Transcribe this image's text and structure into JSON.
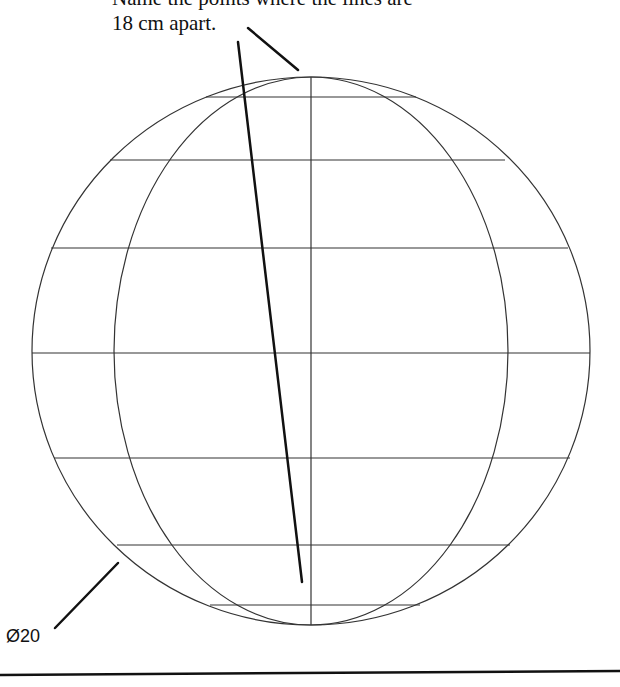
{
  "annotation": {
    "clipped_line": "Name the points where the lines are",
    "caption": "18 cm apart."
  },
  "dimension": {
    "label": "Ø20"
  },
  "sphere": {
    "cx": 311,
    "cy": 351,
    "rx": 279,
    "ry": 274,
    "inner_meridian_rx": 197,
    "latitude_lines_y": [
      97,
      160,
      248,
      353,
      458,
      545,
      605
    ],
    "stroke": "#333333"
  }
}
